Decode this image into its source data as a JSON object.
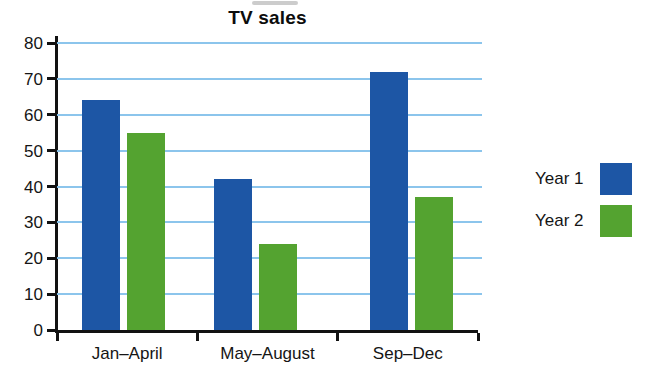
{
  "chart_data": {
    "type": "bar",
    "title": "TV sales",
    "categories": [
      "Jan–April",
      "May–August",
      "Sep–Dec"
    ],
    "series": [
      {
        "name": "Year 1",
        "color": "#1d56a5",
        "values": [
          64,
          42,
          72
        ]
      },
      {
        "name": "Year 2",
        "color": "#54a330",
        "values": [
          55,
          24,
          37
        ]
      }
    ],
    "xlabel": "",
    "ylabel": "",
    "ylim": [
      0,
      80
    ],
    "yticks": [
      0,
      10,
      20,
      30,
      40,
      50,
      60,
      70,
      80
    ],
    "grid": "horizontal",
    "gridline_color": "#8cc5ec",
    "axis_color": "#121212",
    "legend_position": "right"
  }
}
